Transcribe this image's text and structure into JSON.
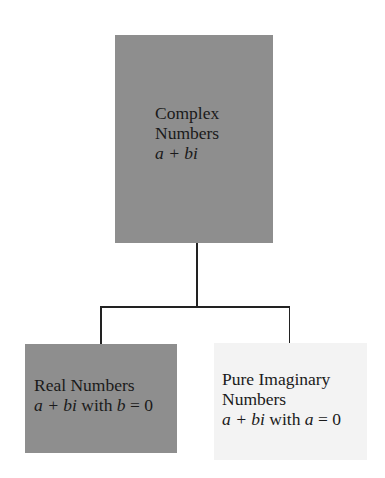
{
  "diagram": {
    "root": {
      "title_line1": "Complex",
      "title_line2": "Numbers",
      "formula": "a + bi",
      "fill": "#8e8e8e"
    },
    "children": [
      {
        "title": "Real Numbers",
        "formula_a": "a + bi",
        "formula_with": " with ",
        "formula_var": "b",
        "formula_cond": " = 0",
        "fill": "#8e8e8e"
      },
      {
        "title_line1": "Pure Imaginary",
        "title_line2": "Numbers",
        "formula_a": "a + bi",
        "formula_with": " with ",
        "formula_var": "a",
        "formula_cond": " = 0",
        "fill": "#f3f3f3"
      }
    ],
    "connector_color": "#222222"
  }
}
